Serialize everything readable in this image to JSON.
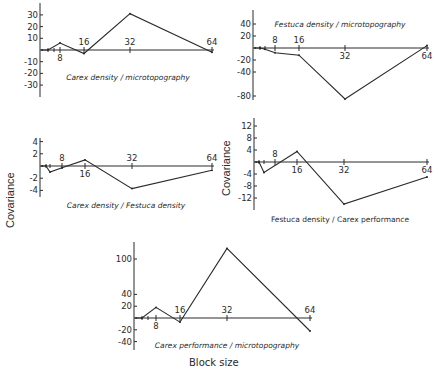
{
  "chart_data": [
    {
      "type": "line",
      "title": "Carex density / microtopography",
      "xlabel": "Block size",
      "ylabel": "Covariance",
      "x": [
        1,
        2,
        8,
        16,
        32,
        64
      ],
      "values": [
        0,
        0,
        6,
        -3,
        31,
        -2
      ],
      "x_ticks": [
        8,
        16,
        32,
        64
      ],
      "y_ticks": [
        30,
        20,
        10,
        -10,
        -20,
        -30
      ],
      "ylim": [
        -40,
        40
      ],
      "grid": false
    },
    {
      "type": "line",
      "title": "Festuca density / microtopography",
      "xlabel": "Block size",
      "ylabel": "Covariance",
      "x": [
        1,
        2,
        4,
        8,
        16,
        32,
        64
      ],
      "values": [
        0,
        0,
        -2,
        -8,
        -12,
        -85,
        4
      ],
      "x_ticks": [
        8,
        16,
        32,
        64
      ],
      "y_ticks": [
        40,
        20,
        -20,
        -40,
        -80
      ],
      "ylim": [
        -90,
        60
      ],
      "grid": false
    },
    {
      "type": "line",
      "title": "Carex density / Festuca density",
      "xlabel": "Block size",
      "ylabel": "Covariance",
      "x": [
        1,
        2,
        4,
        8,
        16,
        32,
        64
      ],
      "values": [
        0,
        0,
        -1,
        -0.3,
        1,
        -3.7,
        -0.7
      ],
      "x_ticks": [
        8,
        16,
        32,
        64
      ],
      "y_ticks": [
        4,
        2,
        -2,
        -4
      ],
      "ylim": [
        -5,
        5
      ],
      "grid": false
    },
    {
      "type": "line",
      "title": "Festuca density / Carex performance",
      "xlabel": "Block size",
      "ylabel": "Covariance",
      "x": [
        1,
        2,
        4,
        16,
        32,
        64
      ],
      "values": [
        0,
        0,
        -3.5,
        3.5,
        -14,
        -5
      ],
      "x_ticks": [
        8,
        16,
        32,
        64
      ],
      "y_ticks": [
        12,
        8,
        4,
        -4,
        -8,
        -12
      ],
      "ylim": [
        -16,
        16
      ],
      "grid": false
    },
    {
      "type": "line",
      "title": "Carex performance / microtopography",
      "xlabel": "Block size",
      "ylabel": "Covariance",
      "x": [
        1,
        2,
        8,
        16,
        32,
        64
      ],
      "values": [
        0,
        0,
        18,
        -7,
        118,
        -22
      ],
      "x_ticks": [
        8,
        16,
        32,
        64
      ],
      "y_ticks": [
        100,
        40,
        20,
        -20,
        -40
      ],
      "ylim": [
        -45,
        140
      ],
      "grid": false
    }
  ],
  "labels": {
    "ylabel_left": "Covariance",
    "ylabel_right": "Covariance",
    "xlabel": "Block size"
  },
  "panels": [
    {
      "title": "Carex density / microtopography",
      "yticks": [
        {
          "v": 30,
          "l": "30"
        },
        {
          "v": 20,
          "l": "20"
        },
        {
          "v": 10,
          "l": "10"
        },
        {
          "v": -10,
          "l": "-10"
        },
        {
          "v": -20,
          "l": "-20"
        },
        {
          "v": -30,
          "l": "-30"
        }
      ],
      "xticks": [
        {
          "x": 8,
          "l": "8",
          "pos": "below"
        },
        {
          "x": 16,
          "l": "16",
          "pos": "above"
        },
        {
          "x": 32,
          "l": "32",
          "pos": "above"
        },
        {
          "x": 64,
          "l": "64",
          "pos": "above"
        }
      ],
      "points": [
        [
          1,
          0
        ],
        [
          2,
          0
        ],
        [
          8,
          6
        ],
        [
          16,
          -3
        ],
        [
          32,
          31
        ],
        [
          64,
          -2
        ]
      ]
    },
    {
      "title": "Festuca density / microtopography",
      "yticks": [
        {
          "v": 40,
          "l": "40"
        },
        {
          "v": 20,
          "l": "20"
        },
        {
          "v": -20,
          "l": "-20"
        },
        {
          "v": -40,
          "l": "-40"
        },
        {
          "v": -80,
          "l": "-80"
        }
      ],
      "xticks": [
        {
          "x": 8,
          "l": "8",
          "pos": "above"
        },
        {
          "x": 16,
          "l": "16",
          "pos": "above"
        },
        {
          "x": 32,
          "l": "32",
          "pos": "below"
        },
        {
          "x": 64,
          "l": "64",
          "pos": "below"
        }
      ],
      "points": [
        [
          1,
          0
        ],
        [
          2,
          0
        ],
        [
          4,
          -2
        ],
        [
          8,
          -8
        ],
        [
          16,
          -12
        ],
        [
          32,
          -85
        ],
        [
          64,
          4
        ]
      ]
    },
    {
      "title": "Carex density / Festuca density",
      "yticks": [
        {
          "v": 4,
          "l": "4"
        },
        {
          "v": 2,
          "l": "2"
        },
        {
          "v": -2,
          "l": "-2"
        },
        {
          "v": -4,
          "l": "-4"
        }
      ],
      "xticks": [
        {
          "x": 8,
          "l": "8",
          "pos": "above"
        },
        {
          "x": 16,
          "l": "16",
          "pos": "below"
        },
        {
          "x": 32,
          "l": "32",
          "pos": "above"
        },
        {
          "x": 64,
          "l": "64",
          "pos": "above"
        }
      ],
      "points": [
        [
          1,
          0
        ],
        [
          2,
          0
        ],
        [
          4,
          -1
        ],
        [
          8,
          -0.3
        ],
        [
          16,
          1
        ],
        [
          32,
          -3.7
        ],
        [
          64,
          -0.7
        ]
      ]
    },
    {
      "title": "Festuca density / Carex performance",
      "yticks": [
        {
          "v": 12,
          "l": "12"
        },
        {
          "v": 8,
          "l": "8"
        },
        {
          "v": 4,
          "l": "4"
        },
        {
          "v": -4,
          "l": "-4"
        },
        {
          "v": -8,
          "l": "-8"
        },
        {
          "v": -12,
          "l": "-12"
        }
      ],
      "xticks": [
        {
          "x": 8,
          "l": "8",
          "pos": "above"
        },
        {
          "x": 16,
          "l": "16",
          "pos": "below"
        },
        {
          "x": 32,
          "l": "32",
          "pos": "below"
        },
        {
          "x": 64,
          "l": "64",
          "pos": "below"
        }
      ],
      "points": [
        [
          1,
          0
        ],
        [
          2,
          0
        ],
        [
          4,
          -3.5
        ],
        [
          16,
          3.5
        ],
        [
          32,
          -14
        ],
        [
          64,
          -5
        ]
      ]
    },
    {
      "title": "Carex performance / microtopography",
      "yticks": [
        {
          "v": 100,
          "l": "100"
        },
        {
          "v": 40,
          "l": "40"
        },
        {
          "v": 20,
          "l": "20"
        },
        {
          "v": -20,
          "l": "-20"
        },
        {
          "v": -40,
          "l": "-40"
        }
      ],
      "xticks": [
        {
          "x": 8,
          "l": "8",
          "pos": "below"
        },
        {
          "x": 16,
          "l": "16",
          "pos": "above"
        },
        {
          "x": 32,
          "l": "32",
          "pos": "above"
        },
        {
          "x": 64,
          "l": "64",
          "pos": "above"
        }
      ],
      "points": [
        [
          1,
          0
        ],
        [
          2,
          0
        ],
        [
          8,
          18
        ],
        [
          16,
          -7
        ],
        [
          32,
          118
        ],
        [
          64,
          -22
        ]
      ]
    }
  ]
}
